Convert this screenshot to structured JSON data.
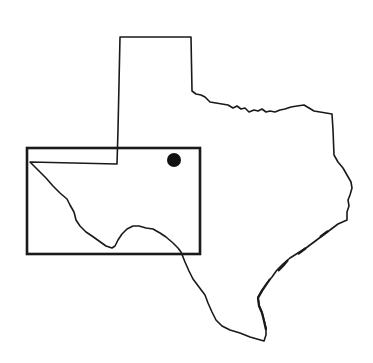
{
  "map": {
    "subject": "Texas state outline",
    "colors": {
      "background": "#ffffff",
      "line": "#1a1a1a",
      "marker": "#111111"
    },
    "inset_rectangle": {
      "x": 27,
      "y": 148,
      "width": 173,
      "height": 106
    },
    "marker": {
      "cx": 174,
      "cy": 160,
      "r": 7
    }
  }
}
